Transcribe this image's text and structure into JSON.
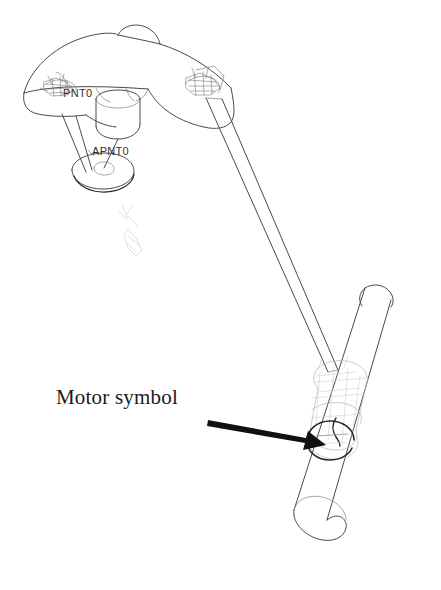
{
  "figure": {
    "background_color": "#ffffff",
    "line_color": "#4a4a4a",
    "annotation_color": "#111111",
    "width": 441,
    "height": 590
  },
  "annotations": {
    "motor_symbol_label": "Motor symbol",
    "arrow": {
      "name": "leader-arrow",
      "from_x": 208,
      "from_y": 423,
      "to_x": 326,
      "to_y": 445
    }
  },
  "cad_tags": [
    {
      "id": "pnt0",
      "text": "PNT0",
      "x": 63,
      "y": 97
    },
    {
      "id": "apnt0",
      "text": "APNT0",
      "x": 92,
      "y": 155
    }
  ],
  "parts": {
    "dome": "upper-platform-dome",
    "pulley": "lower-pulley-disc",
    "rod_left": "connecting-rod-left",
    "rod_right": "connecting-rod-right",
    "cylinder": "lower-cylinder-link",
    "motor": "motor-symbol-circle",
    "joint_left": "left-joint-cluster",
    "joint_right": "right-joint-cluster",
    "detail_symbol": "small-detail-symbol"
  }
}
